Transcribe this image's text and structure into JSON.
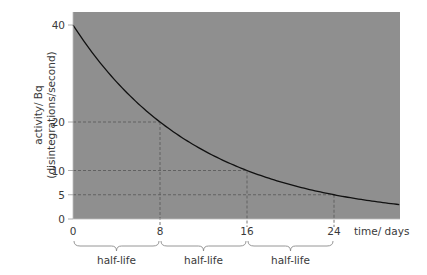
{
  "chart_data": {
    "type": "line",
    "title": "",
    "xlabel": "time/ days",
    "ylabel": "activity/ Bq",
    "ylabel_sub": "(disintegrations/second)",
    "xlim": [
      0,
      30
    ],
    "ylim": [
      0,
      42.7
    ],
    "x_ticks": [
      0,
      8,
      16,
      24
    ],
    "y_ticks": [
      0,
      5,
      10,
      20,
      40
    ],
    "grid": false,
    "background": "#8f8f8f",
    "line_color": "#111111",
    "series": [
      {
        "name": "activity",
        "function": "40 * 0.5^(t/8)",
        "x": [
          0,
          2,
          4,
          6,
          8,
          10,
          12,
          14,
          16,
          18,
          20,
          22,
          24,
          26,
          28,
          30
        ],
        "y": [
          40,
          33.6,
          28.3,
          23.8,
          20,
          16.8,
          14.1,
          11.9,
          10,
          8.4,
          7.1,
          5.9,
          5,
          4.2,
          3.5,
          3.0
        ]
      }
    ],
    "guides": [
      {
        "x": 8,
        "y": 20
      },
      {
        "x": 16,
        "y": 10
      },
      {
        "x": 24,
        "y": 5
      }
    ],
    "annotations": [
      {
        "from": 0,
        "to": 8,
        "text": "half-life"
      },
      {
        "from": 8,
        "to": 16,
        "text": "half-life"
      },
      {
        "from": 16,
        "to": 24,
        "text": "half-life"
      }
    ]
  },
  "labels": {
    "xlabel": "time/ days",
    "ylabel_line1": "activity/ Bq",
    "ylabel_line2": "(disintegrations/second)",
    "x_ticks": [
      "0",
      "8",
      "16",
      "24"
    ],
    "y_ticks": [
      "0",
      "5",
      "10",
      "20",
      "40"
    ],
    "braces": [
      "half-life",
      "half-life",
      "half-life"
    ]
  }
}
